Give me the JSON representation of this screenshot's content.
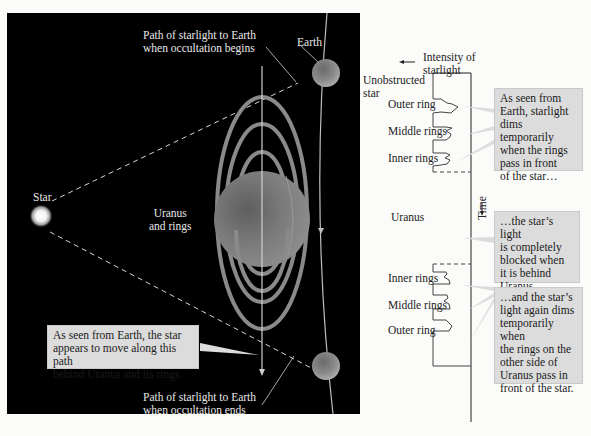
{
  "scene": {
    "star_label": "Star",
    "earth_label": "Earth",
    "uranus_label_line1": "Uranus",
    "uranus_label_line2": "and rings",
    "path_begin_line1": "Path of starlight to Earth",
    "path_begin_line2": "when occultation begins",
    "path_end_line1": "Path of starlight to Earth",
    "path_end_line2": "when occultation ends",
    "callout_path": {
      "line1": "As seen from Earth, the star",
      "line2": "appears to move along this path",
      "line3": "behind Uranus and its rings."
    }
  },
  "graph": {
    "axis_intensity_line1": "Intensity of",
    "axis_intensity_line2": "starlight",
    "axis_time": "Time",
    "labels_before": {
      "unobstructed_line1": "Unobstructed",
      "unobstructed_line2": "star",
      "outer": "Outer ring",
      "middle": "Middle rings",
      "inner": "Inner rings"
    },
    "uranus": "Uranus",
    "labels_after": {
      "inner": "Inner rings",
      "middle": "Middle rings",
      "outer": "Outer ring"
    },
    "callout_dims": {
      "line1": "As seen from",
      "line2": "Earth, starlight",
      "line3": "dims temporarily",
      "line4": "when the rings",
      "line5": "pass in front",
      "line6": "of the star…"
    },
    "callout_blocked": {
      "line1": "…the star’s light",
      "line2": "is completely",
      "line3": "blocked when",
      "line4": "it is behind",
      "line5": "Uranus…"
    },
    "callout_again": {
      "line1": "…and the star’s",
      "line2": "light again dims",
      "line3": "temporarily when",
      "line4": "the rings on the",
      "line5": "other side of",
      "line6": "Uranus pass in",
      "line7": "front of the star."
    }
  },
  "colors": {
    "background": "#fbfbfa",
    "panel": "#000000",
    "callout": "#dcdcdc",
    "rings": "#8a8a8a",
    "planet": "#7a7a7a"
  }
}
